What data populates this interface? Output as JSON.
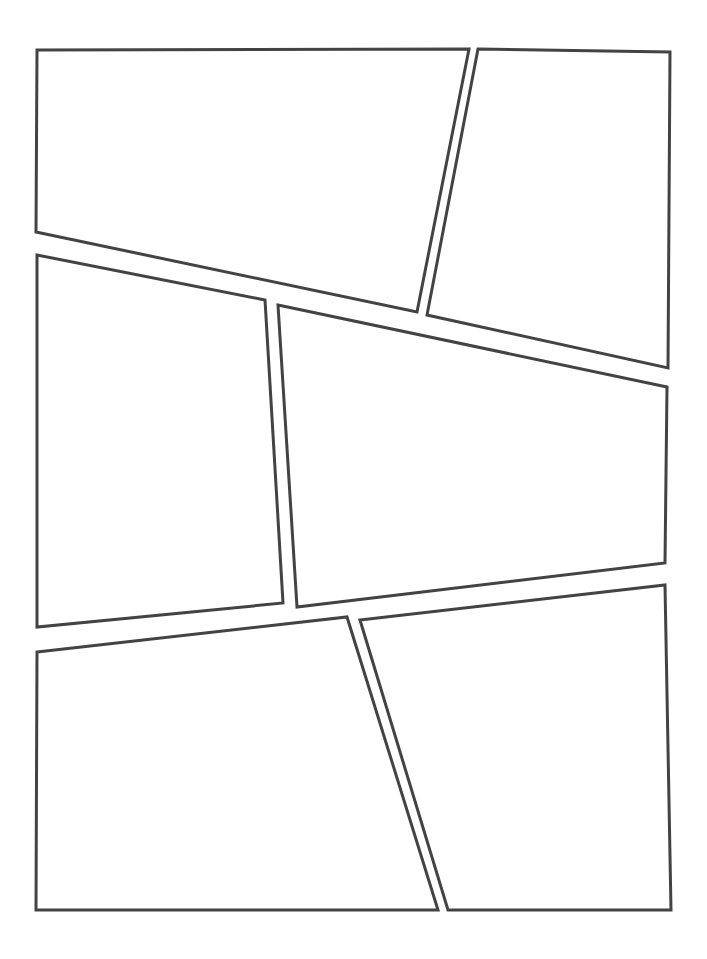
{
  "page": {
    "kind": "comic-page-template",
    "width": 707,
    "height": 959,
    "background_color": "#ffffff",
    "panel_count": 6,
    "panel_fill_color": "#ffffff",
    "panel_border_color": "#434343",
    "panel_border_width": 3,
    "gutter_average": 12
  },
  "panels": [
    {
      "id": "panel-1",
      "label": "Panel 1",
      "position": "top-left",
      "shape": "quadrilateral",
      "points": "37,50 469,49 417,312 36,232",
      "corners": [
        {
          "name": "top-left",
          "x": 37,
          "y": 50
        },
        {
          "name": "top-right",
          "x": 469,
          "y": 49
        },
        {
          "name": "bottom-right",
          "x": 417,
          "y": 312
        },
        {
          "name": "bottom-left",
          "x": 36,
          "y": 232
        }
      ]
    },
    {
      "id": "panel-2",
      "label": "Panel 2",
      "position": "top-right",
      "shape": "quadrilateral",
      "points": "478,49 670,52 668,368 427,315",
      "corners": [
        {
          "name": "top-left",
          "x": 478,
          "y": 49
        },
        {
          "name": "top-right",
          "x": 670,
          "y": 52
        },
        {
          "name": "bottom-right",
          "x": 668,
          "y": 368
        },
        {
          "name": "bottom-left",
          "x": 427,
          "y": 315
        }
      ]
    },
    {
      "id": "panel-3",
      "label": "Panel 3",
      "position": "middle-left",
      "shape": "quadrilateral",
      "points": "37,255 265,300 283,603 37,627",
      "corners": [
        {
          "name": "top-left",
          "x": 37,
          "y": 255
        },
        {
          "name": "top-right",
          "x": 265,
          "y": 300
        },
        {
          "name": "bottom-right",
          "x": 283,
          "y": 603
        },
        {
          "name": "bottom-left",
          "x": 37,
          "y": 627
        }
      ]
    },
    {
      "id": "panel-4",
      "label": "Panel 4",
      "position": "middle-right",
      "shape": "quadrilateral",
      "points": "278,305 667,387 665,563 297,607",
      "corners": [
        {
          "name": "top-left",
          "x": 278,
          "y": 305
        },
        {
          "name": "top-right",
          "x": 667,
          "y": 387
        },
        {
          "name": "bottom-right",
          "x": 665,
          "y": 563
        },
        {
          "name": "bottom-left",
          "x": 297,
          "y": 607
        }
      ]
    },
    {
      "id": "panel-5",
      "label": "Panel 5",
      "position": "bottom-left",
      "shape": "quadrilateral",
      "points": "37,652 347,617 438,910 36,910",
      "corners": [
        {
          "name": "top-left",
          "x": 37,
          "y": 652
        },
        {
          "name": "top-right",
          "x": 347,
          "y": 617
        },
        {
          "name": "bottom-right",
          "x": 438,
          "y": 910
        },
        {
          "name": "bottom-left",
          "x": 36,
          "y": 910
        }
      ]
    },
    {
      "id": "panel-6",
      "label": "Panel 6",
      "position": "bottom-right",
      "shape": "quadrilateral",
      "points": "360,620 665,585 671,910 448,910",
      "corners": [
        {
          "name": "top-left",
          "x": 360,
          "y": 620
        },
        {
          "name": "top-right",
          "x": 665,
          "y": 585
        },
        {
          "name": "bottom-right",
          "x": 671,
          "y": 910
        },
        {
          "name": "bottom-left",
          "x": 448,
          "y": 910
        }
      ]
    }
  ]
}
